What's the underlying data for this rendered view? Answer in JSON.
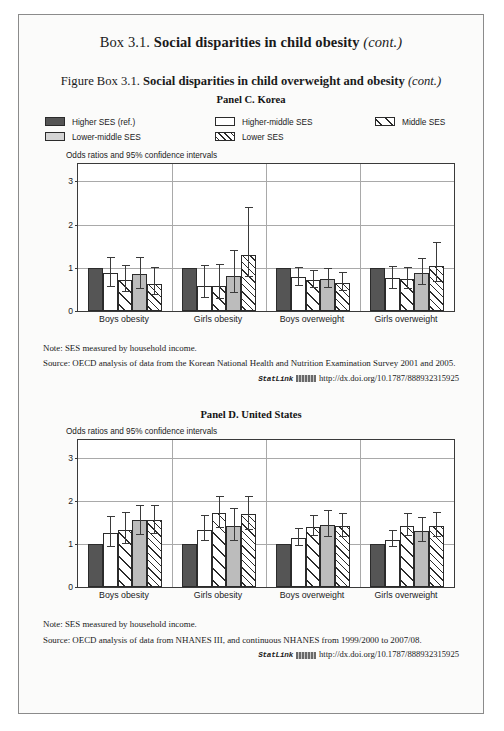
{
  "box": {
    "prefix": "Box 3.1.",
    "title": "Social disparities in child obesity",
    "cont": "(cont.)"
  },
  "figure": {
    "prefix": "Figure Box 3.1.",
    "title": "Social disparities in child overweight and obesity",
    "cont": "(cont.)"
  },
  "legend": {
    "items": [
      {
        "label": "Higher SES (ref.)",
        "swatch": "solid-dark-gray"
      },
      {
        "label": "Higher-middle SES",
        "swatch": "white"
      },
      {
        "label": "Middle SES",
        "swatch": "wide-diagonal-hatch"
      },
      {
        "label": "Lower-middle SES",
        "swatch": "solid-light-gray"
      },
      {
        "label": "Lower SES",
        "swatch": "dense-diagonal-hatch"
      }
    ]
  },
  "panelC": {
    "title": "Panel C. Korea",
    "axis_note": "Odds ratios and 95% confidence intervals",
    "note_label": "Note:",
    "note_text": "SES measured by household income.",
    "source_label": "Source:",
    "source_text": "OECD analysis of data from the Korean National Health and Nutrition Examination Survey 2001 and 2005.",
    "statlink_label": "StatLink",
    "statlink_url": "http://dx.doi.org/10.1787/888932315925"
  },
  "panelD": {
    "title": "Panel D. United States",
    "axis_note": "Odds ratios and 95% confidence intervals",
    "note_label": "Note:",
    "note_text": "SES measured by household income.",
    "source_label": "Source:",
    "source_text": "OECD analysis of data from NHANES III, and continuous NHANES from 1999/2000 to 2007/08.",
    "statlink_label": "StatLink",
    "statlink_url": "http://dx.doi.org/10.1787/888932315925"
  },
  "chart_data": [
    {
      "type": "bar",
      "title": "Panel C. Korea",
      "subtitle": "Social disparities in child overweight and obesity",
      "ylabel": "Odds ratios and 95% confidence intervals",
      "xlabel": "",
      "ylim": [
        0,
        3.4
      ],
      "yticks": [
        0,
        1,
        2,
        3
      ],
      "grid": true,
      "legend_position": "top",
      "categories": [
        "Boys obesity",
        "Girls obesity",
        "Boys overweight",
        "Girls overweight"
      ],
      "series": [
        {
          "name": "Higher SES (ref.)",
          "values": [
            1.0,
            1.0,
            1.0,
            1.0
          ],
          "ci_low": [
            1.0,
            1.0,
            1.0,
            1.0
          ],
          "ci_high": [
            1.0,
            1.0,
            1.0,
            1.0
          ]
        },
        {
          "name": "Higher-middle SES",
          "values": [
            0.88,
            0.58,
            0.78,
            0.76
          ],
          "ci_low": [
            0.56,
            0.29,
            0.58,
            0.52
          ],
          "ci_high": [
            1.25,
            1.07,
            1.02,
            1.05
          ]
        },
        {
          "name": "Middle SES",
          "values": [
            0.71,
            0.58,
            0.71,
            0.74
          ],
          "ci_low": [
            0.45,
            0.27,
            0.53,
            0.5
          ],
          "ci_high": [
            1.06,
            1.08,
            0.95,
            1.02
          ]
        },
        {
          "name": "Lower-middle SES",
          "values": [
            0.85,
            0.8,
            0.74,
            0.88
          ],
          "ci_low": [
            0.52,
            0.41,
            0.54,
            0.6
          ],
          "ci_high": [
            1.24,
            1.41,
            0.99,
            1.23
          ]
        },
        {
          "name": "Lower SES",
          "values": [
            0.62,
            1.3,
            0.64,
            1.05
          ],
          "ci_low": [
            0.38,
            0.78,
            0.46,
            0.68
          ],
          "ci_high": [
            1.02,
            2.4,
            0.9,
            1.6
          ]
        }
      ]
    },
    {
      "type": "bar",
      "title": "Panel D. United States",
      "subtitle": "Social disparities in child overweight and obesity",
      "ylabel": "Odds ratios and 95% confidence intervals",
      "xlabel": "",
      "ylim": [
        0,
        3.4
      ],
      "yticks": [
        0,
        1,
        2,
        3
      ],
      "grid": true,
      "legend_position": "top",
      "categories": [
        "Boys obesity",
        "Girls obesity",
        "Boys overweight",
        "Girls overweight"
      ],
      "series": [
        {
          "name": "Higher SES (ref.)",
          "values": [
            1.0,
            1.0,
            1.0,
            1.0
          ],
          "ci_low": [
            1.0,
            1.0,
            1.0,
            1.0
          ],
          "ci_high": [
            1.0,
            1.0,
            1.0,
            1.0
          ]
        },
        {
          "name": "Higher-middle SES",
          "values": [
            1.25,
            1.33,
            1.15,
            1.1
          ],
          "ci_low": [
            0.93,
            1.06,
            0.96,
            0.93
          ],
          "ci_high": [
            1.65,
            1.68,
            1.37,
            1.33
          ]
        },
        {
          "name": "Middle SES",
          "values": [
            1.33,
            1.72,
            1.4,
            1.42
          ],
          "ci_low": [
            1.0,
            1.37,
            1.18,
            1.18
          ],
          "ci_high": [
            1.75,
            2.12,
            1.68,
            1.72
          ]
        },
        {
          "name": "Lower-middle SES",
          "values": [
            1.55,
            1.42,
            1.45,
            1.3
          ],
          "ci_low": [
            1.2,
            1.08,
            1.17,
            1.05
          ],
          "ci_high": [
            1.9,
            1.83,
            1.78,
            1.62
          ]
        },
        {
          "name": "Lower SES",
          "values": [
            1.55,
            1.7,
            1.42,
            1.42
          ],
          "ci_low": [
            1.22,
            1.33,
            1.16,
            1.15
          ],
          "ci_high": [
            1.9,
            2.12,
            1.72,
            1.75
          ]
        }
      ]
    }
  ]
}
